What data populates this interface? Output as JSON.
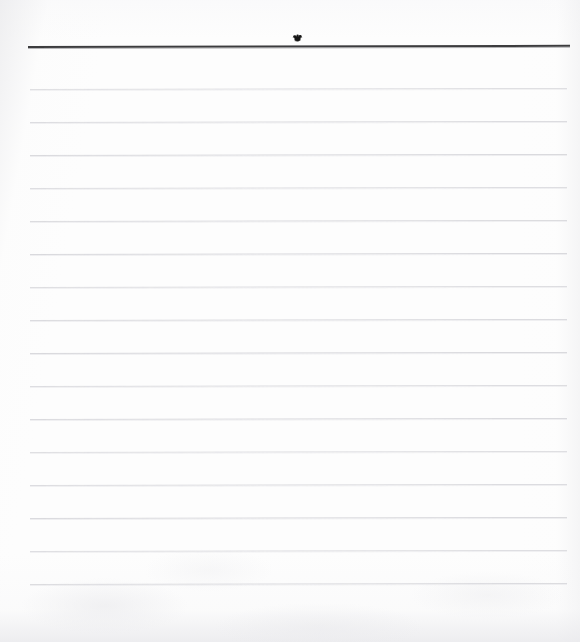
{
  "document": {
    "kind": "scanned-ruled-notebook-page",
    "title": "Blank lined notebook page",
    "page_width": 580,
    "page_height": 642,
    "background_color": "#fdfdfd",
    "written_text": "",
    "body_text_lines": []
  },
  "header_rule": {
    "name": "header-rule",
    "color": "#3c3c3e",
    "x": 28,
    "y": 46,
    "width": 542,
    "thickness": 2
  },
  "ink_blot": {
    "name": "ink-blot",
    "color": "#1a1a1a",
    "x": 291,
    "y": 33,
    "width": 13,
    "height": 9
  },
  "rules": {
    "name": "ruled-lines",
    "color": "#d9d9dd",
    "x": 30,
    "width": 537,
    "thickness": 1,
    "spacing": 33,
    "count": 16,
    "y_positions": [
      89,
      122,
      155,
      188,
      221,
      254,
      287,
      320,
      353,
      386,
      419,
      452,
      485,
      518,
      551,
      584
    ]
  }
}
